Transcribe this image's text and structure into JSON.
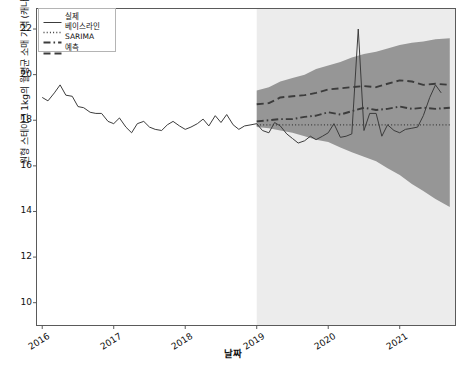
{
  "chart_data": {
    "type": "line",
    "title": "",
    "xlabel": "날짜",
    "ylabel": "원형 스테이크 1kg의 월평균 소매 가격 (캐나다 달러)",
    "ylim": [
      9.0,
      22.9
    ],
    "yticks": [
      10,
      12,
      14,
      16,
      18,
      20,
      22
    ],
    "xlim": [
      2015.92,
      2021.78
    ],
    "xticks": [
      2016,
      2017,
      2018,
      2019,
      2020,
      2021
    ],
    "xtick_labels": [
      "2016",
      "2017",
      "2018",
      "2019",
      "2020",
      "2021"
    ],
    "grid": false,
    "legend_position": "upper-left",
    "forecast_start": 2019.0,
    "forecast_shading_color": "#ececec",
    "interval_band_color": "#969696",
    "line_color": "#3c3c3c",
    "axis_color": "#5a5a5a",
    "baseline_value": 17.8,
    "series": [
      {
        "name": "실제",
        "style": "solid",
        "x": [
          2016.0,
          2016.08,
          2016.17,
          2016.25,
          2016.33,
          2016.42,
          2016.5,
          2016.58,
          2016.67,
          2016.75,
          2016.83,
          2016.92,
          2017.0,
          2017.08,
          2017.17,
          2017.25,
          2017.33,
          2017.42,
          2017.5,
          2017.58,
          2017.67,
          2017.75,
          2017.83,
          2017.92,
          2018.0,
          2018.08,
          2018.17,
          2018.25,
          2018.33,
          2018.42,
          2018.5,
          2018.58,
          2018.67,
          2018.75,
          2018.83,
          2018.92,
          2019.0,
          2019.08,
          2019.17,
          2019.25,
          2019.33,
          2019.42,
          2019.5,
          2019.58,
          2019.67,
          2019.75,
          2019.83,
          2019.92,
          2020.0,
          2020.08,
          2020.17,
          2020.25,
          2020.33,
          2020.42,
          2020.5,
          2020.58,
          2020.67,
          2020.75,
          2020.83,
          2020.92,
          2021.0,
          2021.08,
          2021.17,
          2021.25,
          2021.33,
          2021.42,
          2021.5,
          2021.58
        ],
        "y": [
          19.0,
          18.85,
          19.2,
          19.55,
          19.1,
          19.05,
          18.6,
          18.55,
          18.35,
          18.3,
          18.3,
          17.95,
          17.85,
          18.1,
          17.7,
          17.45,
          17.85,
          17.95,
          17.7,
          17.6,
          17.55,
          17.8,
          17.95,
          17.75,
          17.6,
          17.7,
          17.85,
          18.05,
          17.75,
          18.2,
          17.9,
          18.25,
          17.8,
          17.6,
          17.75,
          17.8,
          17.85,
          17.55,
          17.45,
          17.9,
          17.75,
          17.4,
          17.2,
          17.0,
          17.1,
          17.3,
          17.15,
          17.3,
          17.45,
          17.85,
          17.25,
          17.3,
          17.4,
          22.0,
          17.55,
          18.3,
          18.3,
          17.3,
          17.8,
          17.55,
          17.45,
          17.6,
          17.65,
          17.7,
          18.2,
          19.0,
          19.55,
          19.2
        ]
      },
      {
        "name": "베이스라인",
        "style": "dotted",
        "x": [
          2019.0,
          2021.7
        ],
        "y": [
          17.8,
          17.8
        ]
      },
      {
        "name": "SARIMA",
        "style": "dashdot",
        "x": [
          2019.0,
          2019.17,
          2019.33,
          2019.5,
          2019.67,
          2019.83,
          2020.0,
          2020.17,
          2020.33,
          2020.5,
          2020.67,
          2020.83,
          2021.0,
          2021.17,
          2021.33,
          2021.5,
          2021.7
        ],
        "y": [
          17.95,
          18.0,
          18.05,
          18.05,
          18.15,
          18.2,
          18.35,
          18.25,
          18.4,
          18.55,
          18.45,
          18.5,
          18.6,
          18.5,
          18.55,
          18.5,
          18.55
        ]
      },
      {
        "name": "예측",
        "style": "dashed",
        "x": [
          2019.0,
          2019.17,
          2019.33,
          2019.5,
          2019.67,
          2019.83,
          2020.0,
          2020.17,
          2020.33,
          2020.5,
          2020.67,
          2020.83,
          2021.0,
          2021.17,
          2021.33,
          2021.5,
          2021.7
        ],
        "y": [
          18.7,
          18.75,
          19.0,
          19.05,
          19.1,
          19.2,
          19.35,
          19.4,
          19.45,
          19.5,
          19.45,
          19.6,
          19.75,
          19.7,
          19.55,
          19.6,
          19.55
        ]
      }
    ],
    "interval": {
      "name": "예측 구간",
      "x": [
        2019.0,
        2019.17,
        2019.33,
        2019.5,
        2019.67,
        2019.83,
        2020.0,
        2020.17,
        2020.33,
        2020.5,
        2020.67,
        2020.83,
        2021.0,
        2021.17,
        2021.33,
        2021.5,
        2021.7
      ],
      "upper": [
        19.3,
        19.45,
        19.7,
        19.85,
        20.0,
        20.25,
        20.4,
        20.55,
        20.75,
        20.9,
        21.0,
        21.15,
        21.3,
        21.4,
        21.45,
        21.55,
        21.6
      ],
      "lower": [
        17.7,
        17.65,
        17.55,
        17.45,
        17.3,
        17.15,
        17.05,
        16.8,
        16.6,
        16.4,
        16.2,
        15.9,
        15.6,
        15.2,
        14.9,
        14.55,
        14.2
      ]
    }
  },
  "legend": {
    "items": [
      {
        "label": "실제",
        "style": "solid"
      },
      {
        "label": "베이스라인",
        "style": "dotted"
      },
      {
        "label": "SARIMA",
        "style": "dashdot"
      },
      {
        "label": "예측",
        "style": "dashed"
      }
    ]
  }
}
